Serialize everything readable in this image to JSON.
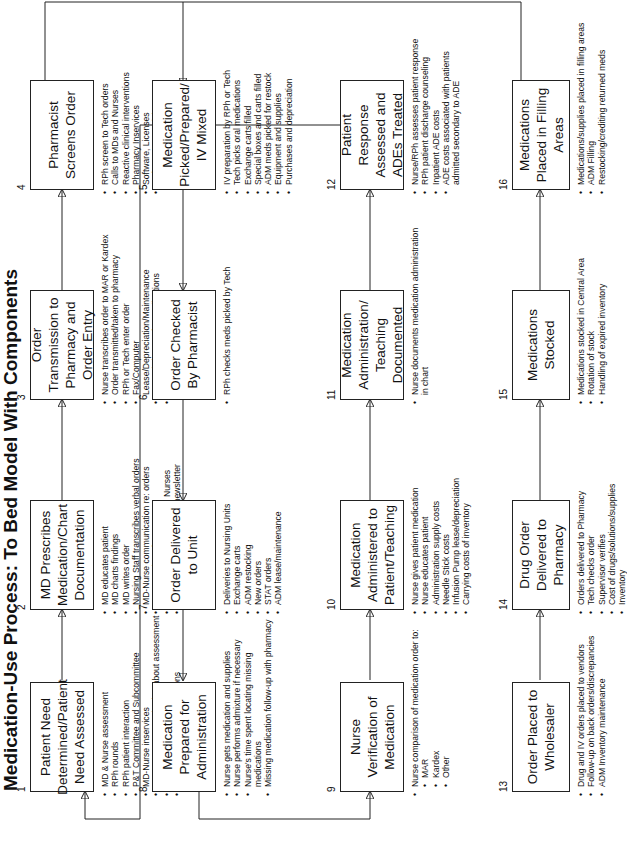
{
  "title": "Medication-Use Process: To Bed Model With Components",
  "nodes": [
    {
      "num": "1",
      "label": "Patient Need Determined/Patient Need Assessed",
      "items": [
        "MD & Nurse assessment",
        "RPh rounds",
        "RPh patient interaction",
        "P&T Committee and Subcommittee",
        "MD-Nurse inservices",
        "MD-Nurse communication about assessment",
        "Medication monographs",
        "Proactive clinical interventions"
      ]
    },
    {
      "num": "2",
      "label": "MD Prescribes Medication/Chart Documentation",
      "items": [
        "MD educates patient",
        "MD charts findings",
        "MD writes order",
        "Nursing Staff transcribes verbal orders",
        "MD-Nurse communication re: orders",
        "MD consults references",
        "RPh inquires from MDs and Nurses",
        "RPh Drug information and newsletter"
      ]
    },
    {
      "num": "3",
      "label": "Order Transmission to Pharmacy and Order Entry",
      "items": [
        "Nurse transcribes order to MAR or Kardex",
        "Order transmitted/taken to pharmacy",
        "RPh or Tech enter order",
        "Fax/Computer Lease/Depreciation/Maintenance",
        "Manual charges for medications",
        "Lost charges"
      ]
    },
    {
      "num": "4",
      "label": "Pharmacist Screens Order",
      "items": [
        "RPh screen to Tech orders",
        "Calls to MDs and Nurses",
        "Reactive clinical interventions",
        "Pharmacy Inservices",
        "Software, Licenses",
        "Reference materials"
      ]
    },
    {
      "num": "5",
      "label": "Medication Picked/Prepared/ IV Mixed",
      "items": [
        "IV preparation by RPh or Tech",
        "Tech picks oral medications",
        "Exchange carts filled",
        "Special boxes and carts filled",
        "ADM meds picked for restock",
        "Equipment and supplies",
        "Purchases and depreciation"
      ]
    },
    {
      "num": "6",
      "label": "Order Checked By Pharmacist",
      "items": [
        "RPh checks meds picked by Tech"
      ]
    },
    {
      "num": "7",
      "label": "Order Delivered to Unit",
      "items": [
        "Deliveries to Nursing Units",
        "Exchange carts",
        "ADM restocking",
        "New orders",
        "STAT orders",
        "ADM lease/maintenance"
      ]
    },
    {
      "num": "8",
      "label": "Medication Prepared for Administration",
      "items": [
        "Nurse gets medication and supplies",
        "Nurse performs admixture if necessary",
        "Nurse's time spent locating missing medications",
        "Missing medication follow-up with pharmacy"
      ]
    },
    {
      "num": "9",
      "label": "Nurse Verification of Medication",
      "items": [
        "Nurse comparison of medication order to:"
      ],
      "subitems": [
        "MAR",
        "Kardex",
        "Other"
      ]
    },
    {
      "num": "10",
      "label": "Medication Administered to Patient/Teaching",
      "items": [
        "Nurse gives patient medication",
        "Nurse educates patient",
        "Administration supply costs",
        "Needle Stick costs",
        "Infusion Pump lease/depreciation",
        "Carrying costs of inventory"
      ]
    },
    {
      "num": "11",
      "label": "Medication Administration/ Teaching Documented",
      "items": [
        "Nurse documents medication administration in chart"
      ]
    },
    {
      "num": "12",
      "label": "Patient Response Assessed and ADEs Treated",
      "items": [
        "Nurse/RPh assesses patient response",
        "RPh patient discharge counseling",
        "Inpatient ADE costs",
        "ADE costs associated with patients admitted secondary to ADE"
      ]
    },
    {
      "num": "13",
      "label": "Order Placed to Wholesaler",
      "items": [
        "Drug and IV orders placed to vendors",
        "Follow-up on back orders/discrepancies",
        "ADM Inventory maintenance"
      ]
    },
    {
      "num": "14",
      "label": "Drug Order Delivered to Pharmacy",
      "items": [
        "Orders delivered to Pharmacy",
        "Tech checks order",
        "Supervisor verifies",
        "Cost of drugs/solutions/supplies",
        "Inventory"
      ]
    },
    {
      "num": "15",
      "label": "Medications Stocked",
      "items": [
        "Medications stocked in Central Area",
        "Rotation of stock",
        "Handling of expired inventory"
      ]
    },
    {
      "num": "16",
      "label": "Medications Placed in Filling Areas",
      "items": [
        "Medications/supplies placed in filling areas",
        "ADM Filling",
        "Restocking/crediting returned meds"
      ]
    }
  ]
}
